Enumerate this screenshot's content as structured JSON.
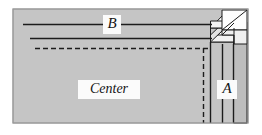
{
  "figure": {
    "background_color": "#ffffff",
    "panel_color": "#c9c9c9",
    "panel_edge_color": "#8f8f8f",
    "line_color": "#1c1c1c",
    "block_face_color": "#fdfdfd",
    "block_shade_color": "#e3e3e3",
    "labels": {
      "a": "A",
      "b": "B",
      "center": "Center"
    },
    "panel": {
      "x": 13,
      "y": 9,
      "width": 235,
      "height": 114
    },
    "horizontal_lines": [
      {
        "name": "line-b",
        "x1": 23,
        "y": 24.5,
        "x2": 212,
        "style": "solid"
      },
      {
        "name": "line-second",
        "x1": 30,
        "y": 38.5,
        "x2": 212,
        "style": "solid"
      },
      {
        "name": "line-dashed",
        "x1": 35,
        "y": 48.5,
        "x2": 209,
        "style": "dashed"
      }
    ],
    "vertical_lines": [
      {
        "name": "vline-dashed",
        "x": 203.5,
        "y1": 48,
        "y2": 123,
        "style": "dashed"
      },
      {
        "name": "vline-inner",
        "x": 210.5,
        "y1": 42,
        "y2": 123,
        "style": "solid"
      },
      {
        "name": "vline-middle",
        "x": 222.5,
        "y1": 46,
        "y2": 123,
        "style": "solid"
      },
      {
        "name": "vline-outer",
        "x": 233.5,
        "y1": 35,
        "y2": 123,
        "style": "solid"
      }
    ]
  }
}
